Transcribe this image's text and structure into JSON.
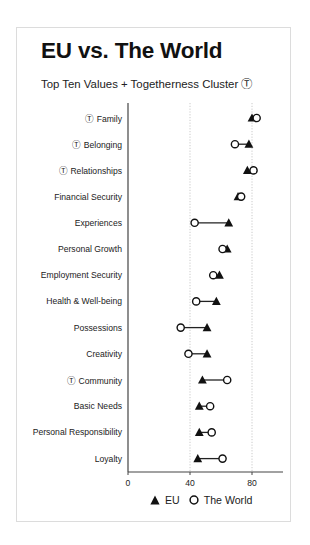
{
  "header": {
    "title": "EU vs. The World",
    "subtitle": "Top Ten Values + Togetherness Cluster Ⓣ"
  },
  "legend": {
    "eu_label": "EU",
    "world_label": "The World",
    "eu_marker": "filled-triangle",
    "world_marker": "open-circle"
  },
  "colors": {
    "marker": "#111111",
    "connector": "#222222",
    "grid": "#bdbdbd",
    "axis": "#444444",
    "card_border": "#dcdcdc"
  },
  "chart_data": {
    "type": "dumbbell",
    "title": "EU vs. The World",
    "subtitle": "Top Ten Values + Togetherness Cluster Ⓣ",
    "xlabel": "",
    "ylabel": "",
    "xlim": [
      0,
      100
    ],
    "xticks": [
      0,
      40,
      80
    ],
    "grid": "vertical dotted at 40 and 80",
    "legend_position": "bottom",
    "categories": [
      "Ⓣ Family",
      "Ⓣ Belonging",
      "Ⓣ Relationships",
      "Financial Security",
      "Experiences",
      "Personal Growth",
      "Employment Security",
      "Health & Well-being",
      "Possessions",
      "Creativity",
      "Ⓣ Community",
      "Basic Needs",
      "Personal Responsibility",
      "Loyalty"
    ],
    "series": [
      {
        "name": "EU",
        "marker": "triangle",
        "values": [
          80,
          78,
          77,
          71,
          65,
          64,
          59,
          57,
          51,
          51,
          48,
          46,
          46,
          45
        ]
      },
      {
        "name": "The World",
        "marker": "circle",
        "values": [
          83,
          69,
          81,
          73,
          43,
          61,
          55,
          44,
          34,
          39,
          64,
          53,
          54,
          61
        ]
      }
    ],
    "annotations": [
      "Ⓣ marks values in the Togetherness Cluster"
    ]
  }
}
